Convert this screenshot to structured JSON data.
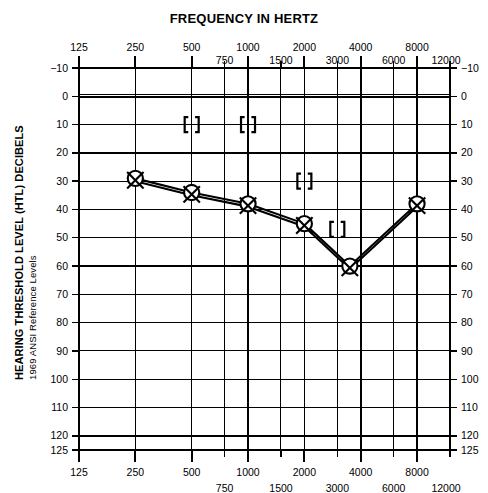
{
  "chart_data": {
    "type": "line",
    "title": "FREQUENCY IN HERTZ",
    "xlabel": "FREQUENCY IN HERTZ",
    "ylabel": "HEARING THRESHOLD LEVEL (HTL) DECIBELS",
    "ylabel_sub": "1969 ANSI Reference Levels",
    "xscale": "log",
    "xlim": [
      125,
      12000
    ],
    "ylim": [
      -10,
      125
    ],
    "y_inverted": true,
    "grid": true,
    "legend_position": "none",
    "x_ticks_major": [
      125,
      250,
      500,
      1000,
      2000,
      4000,
      8000
    ],
    "x_ticks_minor": [
      750,
      1500,
      3000,
      6000,
      12000
    ],
    "x_tick_labels_top_row": [
      "125",
      "250",
      "500",
      "1000",
      "2000",
      "4000",
      "8000"
    ],
    "x_tick_labels_bottom_row": [
      "750",
      "1500",
      "3000",
      "6000",
      "12000"
    ],
    "x_ticks_major_bottom": [
      125,
      250,
      500,
      1000,
      2000,
      4000,
      8000
    ],
    "x_ticks_minor_bottom": [
      750,
      1500,
      3000,
      6000,
      12000
    ],
    "y_ticks": [
      -10,
      0,
      10,
      20,
      30,
      40,
      50,
      60,
      70,
      80,
      90,
      100,
      110,
      120,
      125
    ],
    "y_tick_labels": [
      "−10",
      "0",
      "10",
      "20",
      "30",
      "40",
      "50",
      "60",
      "70",
      "80",
      "90",
      "100",
      "110",
      "120",
      "125"
    ],
    "series": [
      {
        "name": "Right ear air conduction",
        "symbol": "circle-O",
        "x": [
          250,
          500,
          1000,
          2000,
          3500,
          8000
        ],
        "values": [
          29,
          34,
          38,
          45,
          60,
          38
        ]
      },
      {
        "name": "Left ear air conduction",
        "symbol": "cross-X",
        "x": [
          250,
          500,
          1000,
          2000,
          3500,
          8000
        ],
        "values": [
          30,
          35,
          39,
          46,
          61,
          39
        ]
      },
      {
        "name": "Masked bone conduction markers",
        "symbol": "brackets",
        "x": [
          500,
          1000,
          2000,
          3000
        ],
        "values": [
          10,
          10,
          30,
          47
        ]
      }
    ],
    "annotations": []
  },
  "axis": {
    "top_title": "FREQUENCY IN HERTZ",
    "y_title_main": "HEARING THRESHOLD LEVEL (HTL) DECIBELS",
    "y_title_sub": "1969 ANSI Reference Levels"
  }
}
